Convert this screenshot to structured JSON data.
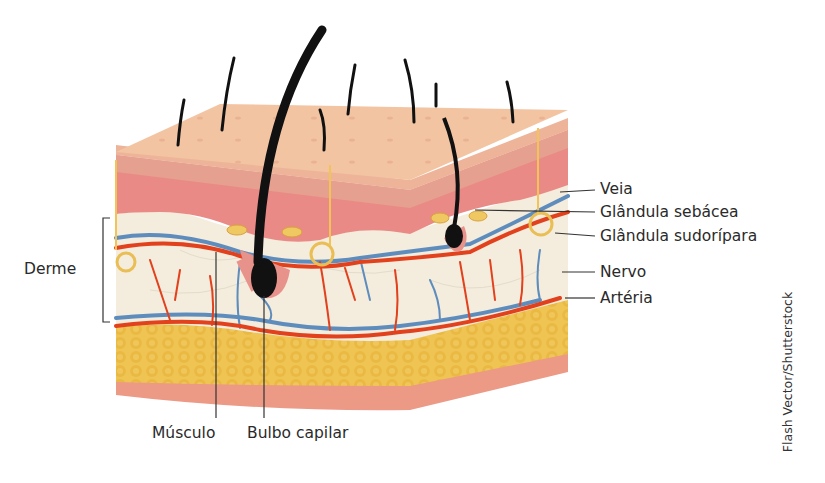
{
  "labels": {
    "derme": "Derme",
    "veia": "Veia",
    "glandula_sebacea": "Glândula sebácea",
    "glandula_sudoripara": "Glândula sudorípara",
    "nervo": "Nervo",
    "arteria": "Artéria",
    "musculo": "Músculo",
    "bulbo_capilar": "Bulbo capilar"
  },
  "credit": "Flash Vector/Shutterstock",
  "colors": {
    "epidermis_top": "#f1c3a0",
    "epidermis_band": "#e7a48f",
    "dermis_pink": "#e98a86",
    "dermis_tissue": "#f4ecdc",
    "fat": "#efc24d",
    "fat_dark": "#e3ad36",
    "muscle_base": "#ec9a86",
    "artery": "#e2411d",
    "vein": "#5e8dbd",
    "hair": "#111111",
    "gland": "#f0c861",
    "nerve": "#f2c457"
  }
}
